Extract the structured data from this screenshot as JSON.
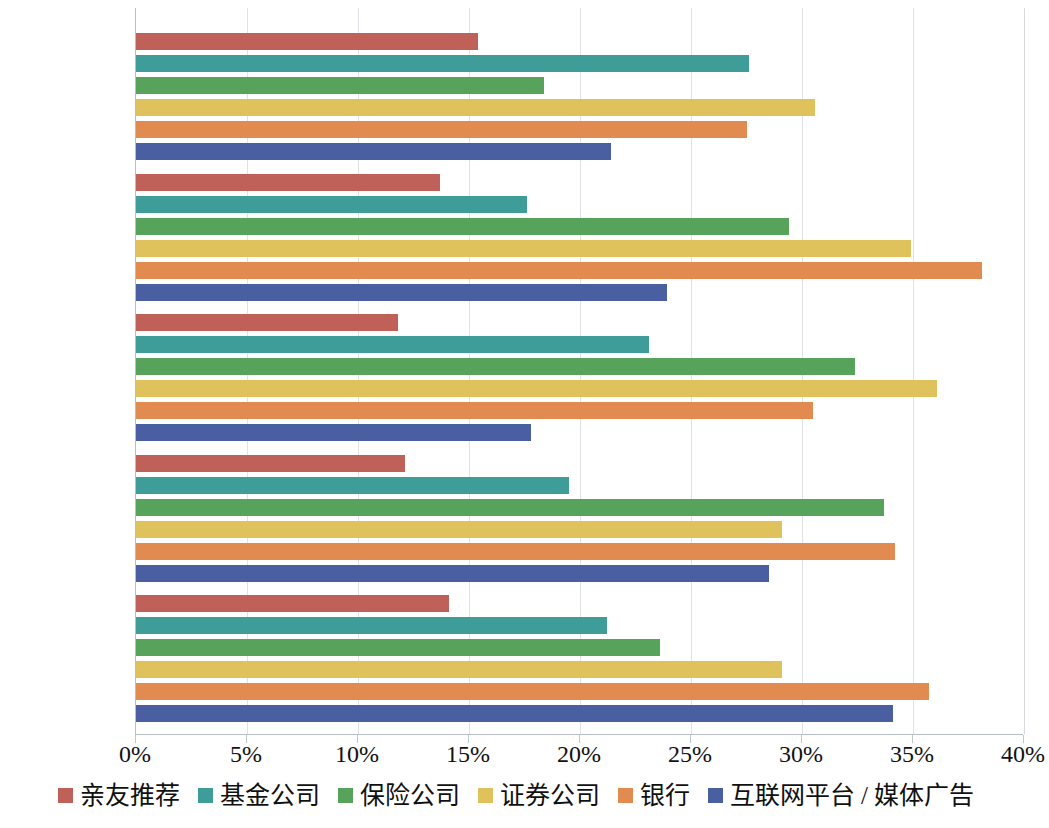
{
  "chart_data": {
    "type": "bar",
    "orientation": "horizontal",
    "title": "",
    "subtitle": "",
    "xlabel": "",
    "ylabel": "",
    "xlim": [
      0,
      40
    ],
    "xticks": [
      "0%",
      "5%",
      "10%",
      "15%",
      "20%",
      "25%",
      "30%",
      "35%",
      "40%"
    ],
    "xtick_values": [
      0,
      5,
      10,
      15,
      20,
      25,
      30,
      35,
      40
    ],
    "grid": true,
    "legend_position": "bottom",
    "categories": [
      "60 岁以上",
      "51—60 岁",
      "41—50 岁",
      "31—40 岁",
      "18—30 岁"
    ],
    "series": [
      {
        "name": "亲友推荐",
        "color": "#c06159",
        "values": [
          15.4,
          13.7,
          11.8,
          12.1,
          14.1
        ]
      },
      {
        "name": "基金公司",
        "color": "#3f9d99",
        "values": [
          27.6,
          17.6,
          23.1,
          19.5,
          21.2
        ]
      },
      {
        "name": "保险公司",
        "color": "#57a35b",
        "values": [
          18.4,
          29.4,
          32.4,
          33.7,
          23.6
        ]
      },
      {
        "name": "证券公司",
        "color": "#e0c25c",
        "values": [
          30.6,
          34.9,
          36.1,
          29.1,
          29.1
        ]
      },
      {
        "name": "银行",
        "color": "#e28b50",
        "values": [
          27.5,
          38.1,
          30.5,
          34.2,
          35.7
        ]
      },
      {
        "name": "互联网平台 / 媒体广告",
        "color": "#4a5fa1",
        "values": [
          21.4,
          23.9,
          17.8,
          28.5,
          34.1
        ]
      }
    ]
  },
  "axis": {
    "x_min_label": "0%",
    "x_max_label": "40%"
  },
  "colors": {
    "亲友推荐": "#c06159",
    "基金公司": "#3f9d99",
    "保险公司": "#57a35b",
    "证券公司": "#e0c25c",
    "银行": "#e28b50",
    "互联网平台 / 媒体广告": "#4a5fa1",
    "gridline": "#dfe3e8",
    "axis": "#b9bfc6",
    "text": "#111111"
  }
}
